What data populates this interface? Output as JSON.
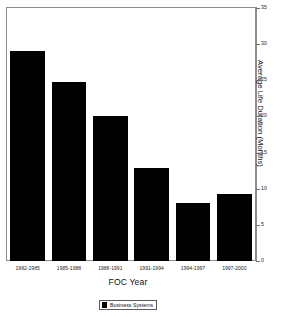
{
  "chart_data": {
    "type": "bar",
    "title": "",
    "categories": [
      "1982-1985",
      "1985-1988",
      "1988-1991",
      "1991-1994",
      "1994-1997",
      "1997-2000"
    ],
    "values": [
      29.0,
      24.8,
      20.0,
      12.8,
      8.0,
      9.3
    ],
    "series": [
      {
        "name": "Business Systems",
        "values": [
          29.0,
          24.8,
          20.0,
          12.8,
          8.0,
          9.3
        ],
        "color": "#000000"
      }
    ],
    "xlabel": "FOC Year",
    "ylabel": "Average Life Duration (Months)",
    "ylim": [
      0,
      35
    ],
    "yticks": [
      0,
      5,
      10,
      15,
      20,
      25,
      30,
      35
    ],
    "ytick_labels": [
      "0",
      "5",
      "10",
      "15",
      "20",
      "25",
      "30",
      "35"
    ],
    "y_axis_position": "right",
    "grid": false,
    "legend": {
      "position": "bottom",
      "entries": [
        {
          "label": "Business Systems",
          "color": "#000000"
        }
      ]
    },
    "bar_color": "#000000",
    "frame_color": "#8c8c8c",
    "background": "#ffffff"
  }
}
